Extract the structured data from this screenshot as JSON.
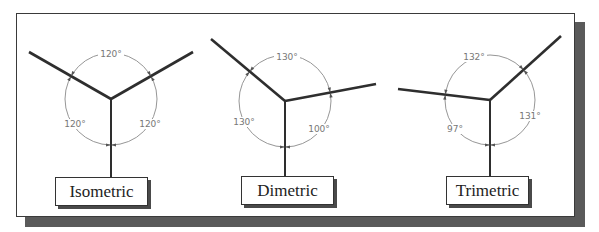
{
  "figure": {
    "colors": {
      "axis": "#2e2e2e",
      "arc": "#8a8a8a",
      "angle_text": "#777777",
      "frame_border": "#3a3a3a",
      "frame_shadow": "#5a5a5a",
      "label_text": "#222222"
    },
    "panels": [
      {
        "name": "Isometric",
        "label": "Isometric",
        "center": [
          111,
          99
        ],
        "radius": 46,
        "axis_ends": {
          "left": [
            29,
            52
          ],
          "right": [
            193,
            52
          ],
          "down": [
            111,
            177
          ]
        },
        "angles": [
          {
            "value": "120°",
            "pos": [
              111,
              57
            ]
          },
          {
            "value": "120°",
            "pos": [
              75,
              127
            ]
          },
          {
            "value": "120°",
            "pos": [
              150,
              127
            ]
          }
        ],
        "box": {
          "x": 55,
          "y": 177,
          "w": 93,
          "h": 29
        }
      },
      {
        "name": "Dimetric",
        "label": "Dimetric",
        "center": [
          285,
          101
        ],
        "radius": 46,
        "axis_ends": {
          "left": [
            211,
            39
          ],
          "right": [
            376,
            84
          ],
          "down": [
            285,
            176
          ]
        },
        "angles": [
          {
            "value": "130°",
            "pos": [
              287,
              60
            ]
          },
          {
            "value": "130°",
            "pos": [
              244,
              125
            ]
          },
          {
            "value": "100°",
            "pos": [
              319,
              132
            ]
          }
        ],
        "box": {
          "x": 241,
          "y": 176,
          "w": 93,
          "h": 29
        }
      },
      {
        "name": "Trimetric",
        "label": "Trimetric",
        "center": [
          490,
          100
        ],
        "radius": 45,
        "axis_ends": {
          "left": [
            398,
            89
          ],
          "right": [
            561,
            36
          ],
          "down": [
            490,
            176
          ]
        },
        "angles": [
          {
            "value": "132°",
            "pos": [
              474,
              60
            ]
          },
          {
            "value": "97°",
            "pos": [
              455,
              132
            ]
          },
          {
            "value": "131°",
            "pos": [
              530,
              119
            ]
          }
        ],
        "box": {
          "x": 446,
          "y": 176,
          "w": 83,
          "h": 29
        }
      }
    ]
  }
}
